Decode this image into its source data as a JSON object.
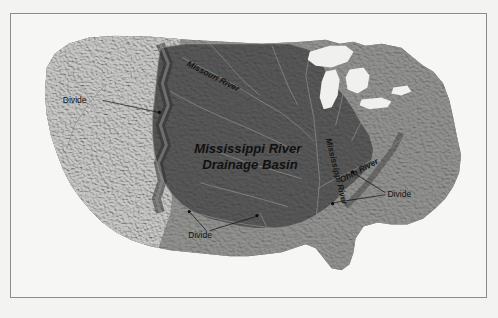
{
  "figure": {
    "kind": "physical-relief-map",
    "region": "Contiguous United States",
    "background_color": "#f3f3f1",
    "frame_border_color": "#8c8c8c",
    "watermark_text": "nagwa.com"
  },
  "map": {
    "terrain": {
      "western_highlands_color": "#9a9a98",
      "basin_fill_color": "#4a4a4a",
      "outside_basin_color": "#6d6d6d",
      "great_lakes_color": "#f0f0ee",
      "ocean_color": "#f6f6f4",
      "river_line_color": "#8f8f8f"
    },
    "labels": [
      {
        "id": "basin",
        "text_line_1": "Mississippi River",
        "text_line_2": "Drainage Basin",
        "x": 247,
        "y": 152
      },
      {
        "id": "missouri",
        "text": "Missouri River",
        "x": 205,
        "y": 62,
        "rotation": 27
      },
      {
        "id": "mississippi",
        "text": "Mississippi River",
        "x": 323,
        "y": 148,
        "rotation": 76
      },
      {
        "id": "ohio",
        "text": "Ohio River",
        "x": 352,
        "y": 162,
        "rotation": -28
      },
      {
        "id": "divide-west",
        "text": "Divide",
        "x": 72,
        "y": 101
      },
      {
        "id": "divide-south",
        "text": "Divide",
        "x": 202,
        "y": 236
      },
      {
        "id": "divide-east",
        "text": "Divide",
        "x": 398,
        "y": 195
      }
    ],
    "annotation_count": 3,
    "named_rivers": [
      "Missouri River",
      "Mississippi River",
      "Ohio River"
    ],
    "named_features": [
      "Mississippi River Drainage Basin",
      "Divide"
    ]
  }
}
